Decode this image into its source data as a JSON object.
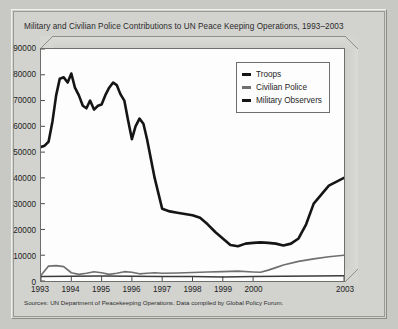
{
  "chart_data": {
    "type": "line",
    "title": "Military and Civilian Police Contributions to UN Peace Keeping Operations, 1993–2003",
    "xlabel": "",
    "ylabel": "",
    "ylim": [
      0,
      90000
    ],
    "yticks": [
      0,
      10000,
      20000,
      30000,
      40000,
      50000,
      60000,
      70000,
      80000,
      90000
    ],
    "ytick_labels": [
      "0",
      "10000",
      "20000",
      "30000",
      "40000",
      "50000",
      "60000",
      "70000",
      "80000",
      "90000"
    ],
    "xtick_labels": [
      "1993",
      "1994",
      "1995",
      "1996",
      "1997",
      "1998",
      "1999",
      "2000",
      "2003"
    ],
    "xtick_positions": [
      0,
      1,
      2,
      3,
      4,
      5,
      6,
      7,
      10
    ],
    "xlim": [
      0,
      10
    ],
    "grid": false,
    "legend_position": "upper right",
    "series": [
      {
        "name": "Troops",
        "color": "#151515",
        "x": [
          0,
          0.12,
          0.25,
          0.38,
          0.5,
          0.62,
          0.75,
          0.88,
          1.0,
          1.12,
          1.25,
          1.38,
          1.5,
          1.62,
          1.75,
          1.88,
          2.0,
          2.12,
          2.25,
          2.38,
          2.5,
          2.62,
          2.75,
          2.88,
          3.0,
          3.12,
          3.25,
          3.38,
          3.5,
          3.75,
          4.0,
          4.25,
          4.5,
          4.75,
          5.0,
          5.25,
          5.5,
          5.75,
          6.0,
          6.25,
          6.5,
          6.75,
          7.0,
          7.25,
          7.5,
          7.75,
          8.0,
          8.25,
          8.5,
          8.75,
          9.0,
          9.5,
          10.0
        ],
        "y": [
          52000,
          52500,
          54000,
          62000,
          72000,
          78500,
          79000,
          77000,
          80500,
          75000,
          72000,
          68000,
          67000,
          70000,
          66500,
          68000,
          68500,
          72000,
          75000,
          77000,
          76000,
          72500,
          70000,
          62000,
          55000,
          60000,
          63000,
          61000,
          55000,
          40000,
          28000,
          27000,
          26500,
          26000,
          25500,
          24500,
          22000,
          19000,
          16500,
          14000,
          13500,
          14500,
          14800,
          15000,
          14800,
          14500,
          13800,
          14500,
          16500,
          22000,
          30000,
          37000,
          40000
        ]
      },
      {
        "name": "Civilian Police",
        "color": "#6f6f6f",
        "x": [
          0,
          0.25,
          0.5,
          0.75,
          1.0,
          1.25,
          1.5,
          1.75,
          2.0,
          2.25,
          2.5,
          2.75,
          3.0,
          3.25,
          3.5,
          3.75,
          4.0,
          4.5,
          5.0,
          5.5,
          6.0,
          6.5,
          7.0,
          7.25,
          7.5,
          7.75,
          8.0,
          8.5,
          9.0,
          9.5,
          10.0
        ],
        "y": [
          2200,
          5800,
          6000,
          5600,
          3200,
          2600,
          3000,
          3600,
          3200,
          2600,
          3000,
          3600,
          3400,
          2800,
          3000,
          3200,
          3000,
          3100,
          3300,
          3500,
          3600,
          3800,
          3500,
          3400,
          4200,
          5200,
          6200,
          7600,
          8600,
          9400,
          10000
        ]
      },
      {
        "name": "Military Observers",
        "color": "#3a3a3a",
        "x": [
          0,
          1,
          2,
          3,
          4,
          5,
          6,
          7,
          8,
          9,
          10
        ],
        "y": [
          1700,
          1800,
          1900,
          1800,
          1700,
          1700,
          1600,
          1700,
          1800,
          1900,
          2000
        ]
      }
    ]
  },
  "legend": {
    "items": [
      {
        "label": "Troops"
      },
      {
        "label": "Civilian Police"
      },
      {
        "label": "Military Observers"
      }
    ]
  },
  "footer": {
    "source": "Sources: UN Department of Peacekeeping Operations. Data compiled by Global Policy Forum."
  }
}
